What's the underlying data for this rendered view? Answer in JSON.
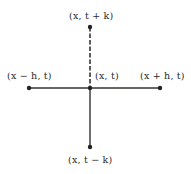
{
  "diagram": {
    "type": "finite-difference-stencil",
    "line_color": "#333333",
    "points": [
      {
        "id": "top",
        "label": "(x, t + k)",
        "cx": 90,
        "cy": 27
      },
      {
        "id": "center",
        "label": "(x, t)",
        "cx": 90,
        "cy": 88
      },
      {
        "id": "left",
        "label": "(x − h, t)",
        "cx": 29,
        "cy": 88
      },
      {
        "id": "right",
        "label": "(x + h, t)",
        "cx": 160,
        "cy": 88
      },
      {
        "id": "bottom",
        "label": "(x, t − k)",
        "cx": 90,
        "cy": 147
      }
    ],
    "edges": [
      {
        "from": "left",
        "to": "right",
        "style": "solid"
      },
      {
        "from": "center",
        "to": "bottom",
        "style": "solid"
      },
      {
        "from": "top",
        "to": "center",
        "style": "dashed"
      }
    ],
    "labels": {
      "top": "(x, t + k)",
      "center": "(x, t)",
      "left": "(x − h, t)",
      "right": "(x + h, t)",
      "bottom": "(x, t − k)"
    }
  }
}
